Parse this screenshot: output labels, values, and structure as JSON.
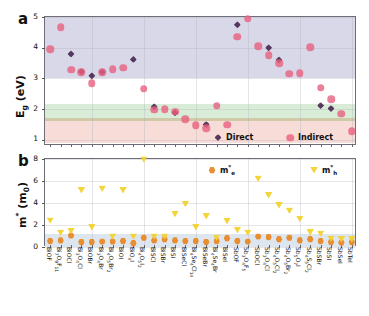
{
  "figure": {
    "panel_a_letter": "a",
    "panel_b_letter": "b"
  },
  "chart_data": [
    {
      "type": "scatter",
      "panel": "a",
      "title": "",
      "xlabel": "",
      "ylabel": "E_g (eV)",
      "ylim": [
        0.8,
        5.0
      ],
      "yticks": [
        1,
        2,
        3,
        4,
        5
      ],
      "grid": true,
      "legend_position": "bottom-right",
      "legend": [
        "Direct",
        "Indirect"
      ],
      "colors": {
        "direct": "#4a2a52",
        "indirect": "#e8607f"
      },
      "shaded_bands": [
        {
          "name": "uv-band",
          "from": 3.0,
          "to": 5.0,
          "color": "#d8d8e8"
        },
        {
          "name": "green-band",
          "from": 1.62,
          "to": 2.18,
          "color": "#d8ecd8"
        },
        {
          "name": "olive-band",
          "from": 1.52,
          "to": 1.72,
          "color": "#cfc9a8"
        },
        {
          "name": "red-band",
          "from": 0.9,
          "to": 1.62,
          "color": "#f7dcd8"
        }
      ],
      "categories": [
        "BiOF",
        "Bi7O9F11",
        "BiOCl",
        "Bi3O4Cl",
        "BiOBr",
        "Bi3O4Br",
        "Bi4O5Br2",
        "BiOI",
        "BiO4I",
        "Bi4O5I2",
        "BiSCl",
        "BiSBr",
        "BiSI",
        "BiSeCl",
        "Bi4Se4Cl14",
        "BiSeBr",
        "Bi4Se4Br",
        "BiSeI",
        "SbOF",
        "Sb3O4F5",
        "SbOCl",
        "Sb3O4Cl",
        "Sb4O5Cl2",
        "Sb4O5Br2",
        "Sb5O7I",
        "Sb4S5Cl2",
        "SbSBr",
        "SbSI",
        "SbSeI",
        "SbTeI"
      ],
      "series": [
        {
          "name": "Direct",
          "marker": "diamond",
          "values": [
            null,
            null,
            3.8,
            3.22,
            3.09,
            3.21,
            null,
            null,
            3.62,
            null,
            2.08,
            null,
            1.88,
            null,
            null,
            1.5,
            null,
            null,
            4.75,
            null,
            null,
            4.0,
            3.6,
            null,
            null,
            null,
            2.12,
            2.02,
            null,
            null
          ]
        },
        {
          "name": "Indirect",
          "marker": "circle",
          "values": [
            3.95,
            4.66,
            3.28,
            3.2,
            2.85,
            3.2,
            3.3,
            3.35,
            null,
            2.67,
            1.98,
            2.0,
            1.92,
            1.68,
            1.47,
            1.38,
            2.11,
            1.5,
            4.36,
            4.95,
            4.05,
            3.75,
            3.5,
            3.15,
            3.17,
            4.02,
            2.7,
            2.32,
            1.85,
            1.28
          ]
        }
      ]
    },
    {
      "type": "scatter",
      "panel": "b",
      "title": "",
      "xlabel": "",
      "ylabel": "m* (m0)",
      "ylim": [
        0,
        8
      ],
      "yticks": [
        0,
        2,
        4,
        6,
        8
      ],
      "grid": true,
      "legend_position": "top-right",
      "legend": [
        "m*e",
        "m*h"
      ],
      "colors": {
        "me": "#e8861f",
        "mh": "#f2d22e"
      },
      "shaded_bands": [
        {
          "name": "low-mass-band",
          "from": 0.0,
          "to": 1.15,
          "color": "#dde6ef"
        }
      ],
      "categories": [
        "BiOF",
        "Bi7O9F11",
        "BiOCl",
        "Bi3O4Cl",
        "BiOBr",
        "Bi3O4Br",
        "Bi4O5Br2",
        "BiOI",
        "BiO4I",
        "Bi4O5I2",
        "BiSCl",
        "BiSBr",
        "BiSI",
        "BiSeCl",
        "Bi4Se4Cl14",
        "BiSeBr",
        "Bi4Se4Br",
        "BiSeI",
        "SbOF",
        "Sb3O4F5",
        "SbOCl",
        "Sb3O4Cl",
        "Sb4O5Cl2",
        "Sb4O5Br2",
        "Sb5O7I",
        "Sb4S5Cl2",
        "SbSBr",
        "SbSI",
        "SbSeI",
        "SbTeI"
      ],
      "series": [
        {
          "name": "m*e",
          "marker": "hexagon",
          "values": [
            0.55,
            0.6,
            1.05,
            0.45,
            0.45,
            0.5,
            0.5,
            0.55,
            0.35,
            0.85,
            0.6,
            0.7,
            0.6,
            0.55,
            0.55,
            0.45,
            0.55,
            0.8,
            0.55,
            0.5,
            0.95,
            0.9,
            0.7,
            0.85,
            0.6,
            0.7,
            0.55,
            0.45,
            0.4,
            0.45
          ]
        },
        {
          "name": "m*h",
          "marker": "triangle-down",
          "values": [
            2.4,
            1.3,
            1.45,
            5.15,
            1.8,
            5.3,
            0.95,
            5.15,
            0.95,
            8.0,
            0.95,
            0.95,
            3.0,
            3.9,
            1.8,
            2.8,
            0.85,
            2.35,
            1.55,
            1.3,
            6.2,
            4.7,
            3.8,
            3.3,
            2.55,
            1.35,
            1.2,
            0.75,
            0.7,
            0.7
          ]
        }
      ]
    }
  ],
  "axis_a": {
    "ylabel_main": "E",
    "ylabel_sub": "g",
    "ylabel_unit": " (eV)",
    "ticks": [
      "5",
      "4",
      "3",
      "2",
      "1"
    ]
  },
  "axis_b": {
    "ylabel_main": "m",
    "ylabel_sup": "*",
    "ylabel_unit": " (m",
    "ylabel_unit_sub": "0",
    "ylabel_unit_end": ")",
    "ticks": [
      "8",
      "6",
      "4",
      "2",
      "0"
    ]
  },
  "legend_a": {
    "direct_label": "Direct",
    "indirect_label": "Indirect"
  },
  "legend_b": {
    "me_main": "m",
    "me_sup": "*",
    "me_sub": "e",
    "mh_main": "m",
    "mh_sup": "*",
    "mh_sub": "h"
  },
  "xtick_labels": [
    {
      "base": "BiOF",
      "parts": [
        [
          "BiOF",
          0
        ]
      ]
    },
    {
      "base": "Bi7O9F11",
      "parts": [
        [
          "Bi",
          0
        ],
        [
          "7",
          1
        ],
        [
          "O",
          0
        ],
        [
          "9",
          1
        ],
        [
          "F",
          0
        ],
        [
          "11",
          1
        ]
      ]
    },
    {
      "base": "BiOCl",
      "parts": [
        [
          "BiOCl",
          0
        ]
      ]
    },
    {
      "base": "Bi3O4Cl",
      "parts": [
        [
          "Bi",
          0
        ],
        [
          "3",
          1
        ],
        [
          "O",
          0
        ],
        [
          "4",
          1
        ],
        [
          "Cl",
          0
        ]
      ]
    },
    {
      "base": "BiOBr",
      "parts": [
        [
          "BiOBr",
          0
        ]
      ]
    },
    {
      "base": "Bi3O4Br",
      "parts": [
        [
          "Bi",
          0
        ],
        [
          "3",
          1
        ],
        [
          "O",
          0
        ],
        [
          "4",
          1
        ],
        [
          "Br",
          0
        ]
      ]
    },
    {
      "base": "Bi4O5Br2",
      "parts": [
        [
          "Bi",
          0
        ],
        [
          "4",
          1
        ],
        [
          "O",
          0
        ],
        [
          "5",
          1
        ],
        [
          "Br",
          0
        ],
        [
          "2",
          1
        ]
      ]
    },
    {
      "base": "BiOI",
      "parts": [
        [
          "BiOI",
          0
        ]
      ]
    },
    {
      "base": "BiO4I",
      "parts": [
        [
          "BiO",
          0
        ],
        [
          "4",
          1
        ],
        [
          "I",
          0
        ]
      ]
    },
    {
      "base": "Bi4O5I2",
      "parts": [
        [
          "Bi",
          0
        ],
        [
          "4",
          1
        ],
        [
          "O",
          0
        ],
        [
          "5",
          1
        ],
        [
          "I",
          0
        ],
        [
          "2",
          1
        ]
      ]
    },
    {
      "base": "BiSCl",
      "parts": [
        [
          "BiSCl",
          0
        ]
      ]
    },
    {
      "base": "BiSBr",
      "parts": [
        [
          "BiSBr",
          0
        ]
      ]
    },
    {
      "base": "BiSI",
      "parts": [
        [
          "BiSI",
          0
        ]
      ]
    },
    {
      "base": "BiSeCl",
      "parts": [
        [
          "BiSeCl",
          0
        ]
      ]
    },
    {
      "base": "Bi4Se4Cl14",
      "parts": [
        [
          "Bi",
          0
        ],
        [
          "4",
          1
        ],
        [
          "Se",
          0
        ],
        [
          "4",
          1
        ],
        [
          "Cl",
          0
        ],
        [
          "14",
          1
        ]
      ]
    },
    {
      "base": "BiSeBr",
      "parts": [
        [
          "BiSeBr",
          0
        ]
      ]
    },
    {
      "base": "Bi4Se4Br",
      "parts": [
        [
          "Bi",
          0
        ],
        [
          "4",
          1
        ],
        [
          "Se",
          0
        ],
        [
          "4",
          1
        ],
        [
          "Br",
          0
        ]
      ]
    },
    {
      "base": "BiSeI",
      "parts": [
        [
          "BiSeI",
          0
        ]
      ]
    },
    {
      "base": "SbOF",
      "parts": [
        [
          "SbOF",
          0
        ]
      ]
    },
    {
      "base": "Sb3O4F5",
      "parts": [
        [
          "Sb",
          0
        ],
        [
          "3",
          1
        ],
        [
          "O",
          0
        ],
        [
          "4",
          1
        ],
        [
          "F",
          0
        ],
        [
          "5",
          1
        ]
      ]
    },
    {
      "base": "SbOCl",
      "parts": [
        [
          "SbOCl",
          0
        ]
      ]
    },
    {
      "base": "Sb3O4Cl",
      "parts": [
        [
          "Sb",
          0
        ],
        [
          "3",
          1
        ],
        [
          "O",
          0
        ],
        [
          "4",
          1
        ],
        [
          "Cl",
          0
        ]
      ]
    },
    {
      "base": "Sb4O5Cl2",
      "parts": [
        [
          "Sb",
          0
        ],
        [
          "4",
          1
        ],
        [
          "O",
          0
        ],
        [
          "5",
          1
        ],
        [
          "Cl",
          0
        ],
        [
          "2",
          1
        ]
      ]
    },
    {
      "base": "Sb4O5Br2",
      "parts": [
        [
          "Sb",
          0
        ],
        [
          "4",
          1
        ],
        [
          "O",
          0
        ],
        [
          "5",
          1
        ],
        [
          "Br",
          0
        ],
        [
          "2",
          1
        ]
      ]
    },
    {
      "base": "Sb5O7I",
      "parts": [
        [
          "Sb",
          0
        ],
        [
          "5",
          1
        ],
        [
          "O",
          0
        ],
        [
          "7",
          1
        ],
        [
          "I",
          0
        ]
      ]
    },
    {
      "base": "Sb4S5Cl2",
      "parts": [
        [
          "Sb",
          0
        ],
        [
          "4",
          1
        ],
        [
          "S",
          0
        ],
        [
          "5",
          1
        ],
        [
          "Cl",
          0
        ],
        [
          "2",
          1
        ]
      ]
    },
    {
      "base": "SbSBr",
      "parts": [
        [
          "SbSBr",
          0
        ]
      ]
    },
    {
      "base": "SbSI",
      "parts": [
        [
          "SbSI",
          0
        ]
      ]
    },
    {
      "base": "SbSeI",
      "parts": [
        [
          "SbSeI",
          0
        ]
      ]
    },
    {
      "base": "SbTeI",
      "parts": [
        [
          "SbTeI",
          0
        ]
      ]
    }
  ]
}
